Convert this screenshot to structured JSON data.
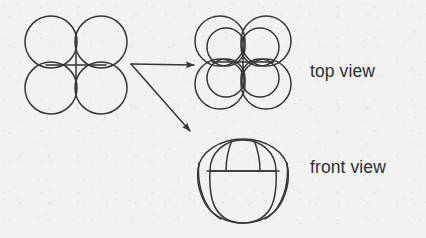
{
  "figure": {
    "background_color": "#f2f2f1",
    "ink_color": "#363636",
    "stroke_width": 1.5
  },
  "labels": {
    "top_view": "top view",
    "front_view": "front view"
  },
  "shapes": {
    "source": {
      "name": "quatrefoil-plan",
      "description": "four overlapping circles in a 2x2 cluster with crossed centre lines",
      "center": {
        "x": 76,
        "y": 65
      },
      "petal_radius": 26,
      "petal_centers": [
        {
          "x": 51,
          "y": 42
        },
        {
          "x": 101,
          "y": 42
        },
        {
          "x": 51,
          "y": 88
        },
        {
          "x": 101,
          "y": 88
        }
      ]
    },
    "top_view": {
      "name": "nested-quatrefoil",
      "description": "outer quatrefoil with a smaller concentric quatrefoil inside and crossed centre lines",
      "center": {
        "x": 243,
        "y": 62
      },
      "outer_petal_radius": 25,
      "inner_petal_radius": 19
    },
    "front_view": {
      "name": "domed-elevation",
      "description": "rounded body with a dome cap, two meridian lines and side crescent lobes",
      "center": {
        "x": 243,
        "y": 180
      },
      "width": 84,
      "height": 82
    }
  },
  "arrows": [
    {
      "name": "arrow-to-top-view",
      "from": {
        "x": 131,
        "y": 64
      },
      "to": {
        "x": 196,
        "y": 65
      },
      "direction": "horizontal-right"
    },
    {
      "name": "arrow-to-front-view",
      "from": {
        "x": 131,
        "y": 64
      },
      "to": {
        "x": 192,
        "y": 133
      },
      "direction": "diagonal-down-right"
    }
  ]
}
